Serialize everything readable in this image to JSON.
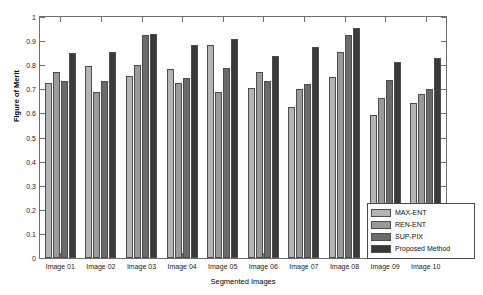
{
  "chart_data": {
    "type": "bar",
    "title": "",
    "xlabel": "Segmented Images",
    "ylabel": "Figure of Merit",
    "ylim": [
      0,
      1
    ],
    "yticks": [
      0,
      0.1,
      0.2,
      0.3,
      0.4,
      0.5,
      0.6,
      0.7,
      0.8,
      0.9,
      1
    ],
    "ytick_labels": [
      "0",
      "0.1",
      "0.2",
      "0.3",
      "0.4",
      "0.5",
      "0.6",
      "0.7",
      "0.8",
      "0.9",
      "1"
    ],
    "grid": false,
    "legend_position": "lower right",
    "categories": [
      "Image 01",
      "Image 02",
      "Image 03",
      "Image 04",
      "Image 05",
      "Image 06",
      "Image 07",
      "Image 08",
      "Image 09",
      "Image 10"
    ],
    "series": [
      {
        "name": "MAX-ENT",
        "color": "#b4b4b4",
        "values": [
          0.725,
          0.795,
          0.755,
          0.785,
          0.885,
          0.705,
          0.625,
          0.75,
          0.595,
          0.645
        ]
      },
      {
        "name": "REN-ENT",
        "color": "#9a9a9a",
        "values": [
          0.77,
          0.69,
          0.8,
          0.725,
          0.69,
          0.77,
          0.7,
          0.855,
          0.665,
          0.68
        ]
      },
      {
        "name": "SUP-PIX",
        "color": "#6b6b6b",
        "values": [
          0.735,
          0.735,
          0.925,
          0.748,
          0.79,
          0.735,
          0.72,
          0.925,
          0.74,
          0.7
        ]
      },
      {
        "name": "Proposed Method",
        "color": "#3a3a3a",
        "values": [
          0.85,
          0.855,
          0.93,
          0.885,
          0.91,
          0.84,
          0.875,
          0.955,
          0.815,
          0.83
        ]
      }
    ]
  },
  "legend": {
    "items": [
      {
        "label": "MAX-ENT",
        "color": "#b4b4b4"
      },
      {
        "label": "REN-ENT",
        "color": "#9a9a9a"
      },
      {
        "label": "SUP-PIX",
        "color": "#6b6b6b"
      },
      {
        "label": "Proposed Method",
        "color": "#3a3a3a"
      }
    ]
  },
  "axes": {
    "y_title": "Figure of Merit",
    "x_title": "Segmented Images"
  }
}
